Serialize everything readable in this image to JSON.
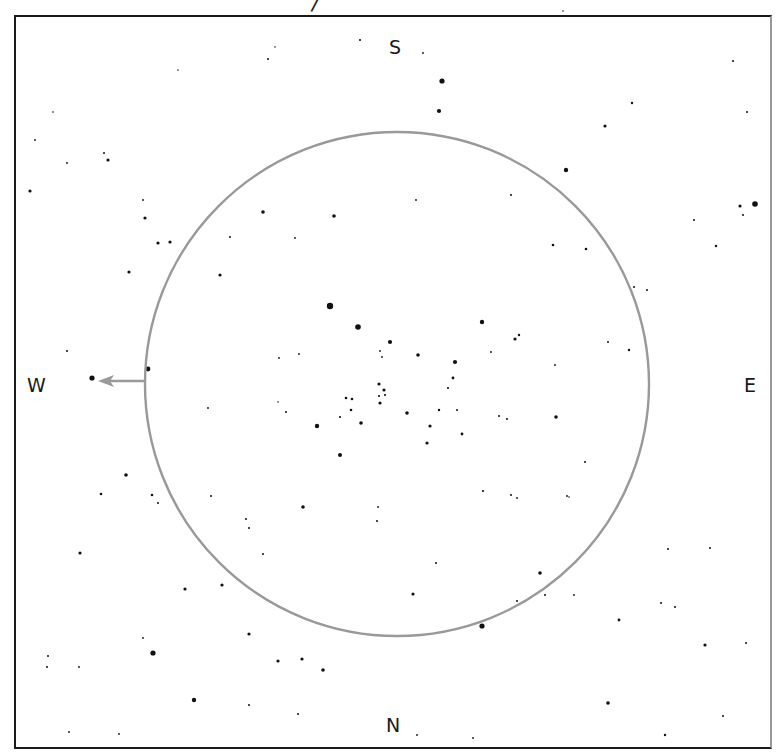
{
  "title_fragment": "/",
  "directions": {
    "north": "N",
    "south": "S",
    "east": "E",
    "west": "W"
  },
  "field_circle": {
    "cx": 397,
    "cy": 384,
    "r": 252,
    "stroke": "#999999"
  },
  "motion_arrow": {
    "from": [
      146,
      381
    ],
    "to": [
      98,
      381
    ],
    "color": "#9a9a9a",
    "target_star": [
      92,
      378
    ]
  },
  "stars": [
    {
      "x": 442,
      "y": 81,
      "r": 2.6
    },
    {
      "x": 439,
      "y": 111,
      "r": 2.1
    },
    {
      "x": 566,
      "y": 170,
      "r": 2.2
    },
    {
      "x": 605,
      "y": 126,
      "r": 1.6
    },
    {
      "x": 632,
      "y": 103,
      "r": 1.2
    },
    {
      "x": 755,
      "y": 204,
      "r": 2.8
    },
    {
      "x": 740,
      "y": 206,
      "r": 1.6
    },
    {
      "x": 743,
      "y": 215,
      "r": 1.0
    },
    {
      "x": 716,
      "y": 246,
      "r": 1.2
    },
    {
      "x": 694,
      "y": 220,
      "r": 1.0
    },
    {
      "x": 747,
      "y": 112,
      "r": 1.0
    },
    {
      "x": 733,
      "y": 61,
      "r": 1.0
    },
    {
      "x": 563,
      "y": 11,
      "r": 0.8
    },
    {
      "x": 360,
      "y": 40,
      "r": 1.1
    },
    {
      "x": 423,
      "y": 53,
      "r": 0.9
    },
    {
      "x": 268,
      "y": 59,
      "r": 1.0
    },
    {
      "x": 275,
      "y": 47,
      "r": 0.8
    },
    {
      "x": 178,
      "y": 70,
      "r": 0.8
    },
    {
      "x": 30,
      "y": 191,
      "r": 1.6
    },
    {
      "x": 104,
      "y": 153,
      "r": 1.0
    },
    {
      "x": 108,
      "y": 160,
      "r": 1.6
    },
    {
      "x": 67,
      "y": 163,
      "r": 0.9
    },
    {
      "x": 35,
      "y": 140,
      "r": 0.9
    },
    {
      "x": 53,
      "y": 112,
      "r": 0.8
    },
    {
      "x": 143,
      "y": 200,
      "r": 0.9
    },
    {
      "x": 145,
      "y": 218,
      "r": 1.6
    },
    {
      "x": 158,
      "y": 243,
      "r": 1.6
    },
    {
      "x": 170,
      "y": 242,
      "r": 1.6
    },
    {
      "x": 129,
      "y": 272,
      "r": 1.6
    },
    {
      "x": 230,
      "y": 237,
      "r": 1.0
    },
    {
      "x": 263,
      "y": 212,
      "r": 1.8
    },
    {
      "x": 334,
      "y": 216,
      "r": 1.8
    },
    {
      "x": 295,
      "y": 238,
      "r": 0.9
    },
    {
      "x": 416,
      "y": 200,
      "r": 0.9
    },
    {
      "x": 511,
      "y": 195,
      "r": 1.0
    },
    {
      "x": 553,
      "y": 245,
      "r": 1.3
    },
    {
      "x": 586,
      "y": 249,
      "r": 1.3
    },
    {
      "x": 634,
      "y": 287,
      "r": 1.0
    },
    {
      "x": 647,
      "y": 290,
      "r": 1.0
    },
    {
      "x": 220,
      "y": 275,
      "r": 1.6
    },
    {
      "x": 330,
      "y": 306,
      "r": 3.2
    },
    {
      "x": 358,
      "y": 327,
      "r": 2.8
    },
    {
      "x": 390,
      "y": 342,
      "r": 2.1
    },
    {
      "x": 482,
      "y": 322,
      "r": 2.2
    },
    {
      "x": 515,
      "y": 339,
      "r": 1.6
    },
    {
      "x": 519,
      "y": 335,
      "r": 1.2
    },
    {
      "x": 455,
      "y": 362,
      "r": 2.1
    },
    {
      "x": 418,
      "y": 355,
      "r": 1.8
    },
    {
      "x": 453,
      "y": 378,
      "r": 1.4
    },
    {
      "x": 448,
      "y": 388,
      "r": 1.1
    },
    {
      "x": 380,
      "y": 351,
      "r": 0.9
    },
    {
      "x": 382,
      "y": 357,
      "r": 0.9
    },
    {
      "x": 379,
      "y": 384,
      "r": 1.6
    },
    {
      "x": 384,
      "y": 390,
      "r": 1.6
    },
    {
      "x": 379,
      "y": 396,
      "r": 1.1
    },
    {
      "x": 385,
      "y": 395,
      "r": 1.1
    },
    {
      "x": 380,
      "y": 403,
      "r": 1.6
    },
    {
      "x": 352,
      "y": 399,
      "r": 1.3
    },
    {
      "x": 346,
      "y": 398,
      "r": 1.3
    },
    {
      "x": 351,
      "y": 410,
      "r": 1.3
    },
    {
      "x": 340,
      "y": 417,
      "r": 1.1
    },
    {
      "x": 361,
      "y": 423,
      "r": 1.8
    },
    {
      "x": 317,
      "y": 426,
      "r": 2.2
    },
    {
      "x": 340,
      "y": 455,
      "r": 2.0
    },
    {
      "x": 299,
      "y": 354,
      "r": 0.9
    },
    {
      "x": 279,
      "y": 358,
      "r": 0.9
    },
    {
      "x": 286,
      "y": 412,
      "r": 1.0
    },
    {
      "x": 278,
      "y": 402,
      "r": 0.8
    },
    {
      "x": 407,
      "y": 413,
      "r": 1.8
    },
    {
      "x": 430,
      "y": 426,
      "r": 1.6
    },
    {
      "x": 439,
      "y": 410,
      "r": 1.2
    },
    {
      "x": 427,
      "y": 443,
      "r": 1.6
    },
    {
      "x": 457,
      "y": 410,
      "r": 1.0
    },
    {
      "x": 462,
      "y": 434,
      "r": 1.4
    },
    {
      "x": 499,
      "y": 416,
      "r": 1.0
    },
    {
      "x": 507,
      "y": 419,
      "r": 1.0
    },
    {
      "x": 556,
      "y": 417,
      "r": 1.8
    },
    {
      "x": 491,
      "y": 352,
      "r": 0.9
    },
    {
      "x": 555,
      "y": 365,
      "r": 0.9
    },
    {
      "x": 608,
      "y": 342,
      "r": 1.0
    },
    {
      "x": 629,
      "y": 350,
      "r": 1.2
    },
    {
      "x": 148,
      "y": 369,
      "r": 2.4
    },
    {
      "x": 92,
      "y": 378,
      "r": 2.6
    },
    {
      "x": 67,
      "y": 351,
      "r": 1.0
    },
    {
      "x": 208,
      "y": 408,
      "r": 0.9
    },
    {
      "x": 126,
      "y": 475,
      "r": 1.8
    },
    {
      "x": 101,
      "y": 494,
      "r": 1.3
    },
    {
      "x": 152,
      "y": 495,
      "r": 1.3
    },
    {
      "x": 158,
      "y": 503,
      "r": 1.0
    },
    {
      "x": 211,
      "y": 496,
      "r": 1.0
    },
    {
      "x": 303,
      "y": 507,
      "r": 1.8
    },
    {
      "x": 246,
      "y": 519,
      "r": 1.0
    },
    {
      "x": 249,
      "y": 528,
      "r": 1.0
    },
    {
      "x": 377,
      "y": 521,
      "r": 1.0
    },
    {
      "x": 378,
      "y": 507,
      "r": 0.9
    },
    {
      "x": 483,
      "y": 491,
      "r": 1.1
    },
    {
      "x": 511,
      "y": 495,
      "r": 1.0
    },
    {
      "x": 585,
      "y": 462,
      "r": 1.0
    },
    {
      "x": 80,
      "y": 553,
      "r": 1.6
    },
    {
      "x": 185,
      "y": 589,
      "r": 1.6
    },
    {
      "x": 222,
      "y": 585,
      "r": 1.6
    },
    {
      "x": 263,
      "y": 554,
      "r": 1.0
    },
    {
      "x": 413,
      "y": 594,
      "r": 1.6
    },
    {
      "x": 436,
      "y": 563,
      "r": 1.0
    },
    {
      "x": 540,
      "y": 573,
      "r": 1.8
    },
    {
      "x": 545,
      "y": 595,
      "r": 1.0
    },
    {
      "x": 517,
      "y": 498,
      "r": 0.9
    },
    {
      "x": 567,
      "y": 496,
      "r": 0.9
    },
    {
      "x": 482,
      "y": 626,
      "r": 2.6
    },
    {
      "x": 517,
      "y": 601,
      "r": 1.0
    },
    {
      "x": 249,
      "y": 634,
      "r": 1.6
    },
    {
      "x": 153,
      "y": 653,
      "r": 2.6
    },
    {
      "x": 143,
      "y": 638,
      "r": 0.9
    },
    {
      "x": 48,
      "y": 656,
      "r": 1.0
    },
    {
      "x": 79,
      "y": 667,
      "r": 0.9
    },
    {
      "x": 47,
      "y": 667,
      "r": 1.0
    },
    {
      "x": 278,
      "y": 661,
      "r": 1.6
    },
    {
      "x": 302,
      "y": 659,
      "r": 1.6
    },
    {
      "x": 323,
      "y": 670,
      "r": 1.8
    },
    {
      "x": 194,
      "y": 700,
      "r": 2.2
    },
    {
      "x": 249,
      "y": 705,
      "r": 1.0
    },
    {
      "x": 298,
      "y": 714,
      "r": 1.0
    },
    {
      "x": 69,
      "y": 732,
      "r": 0.9
    },
    {
      "x": 119,
      "y": 734,
      "r": 0.9
    },
    {
      "x": 661,
      "y": 603,
      "r": 1.0
    },
    {
      "x": 675,
      "y": 607,
      "r": 1.0
    },
    {
      "x": 705,
      "y": 645,
      "r": 1.6
    },
    {
      "x": 746,
      "y": 643,
      "r": 1.0
    },
    {
      "x": 619,
      "y": 620,
      "r": 1.4
    },
    {
      "x": 608,
      "y": 703,
      "r": 1.8
    },
    {
      "x": 665,
      "y": 735,
      "r": 1.2
    },
    {
      "x": 710,
      "y": 548,
      "r": 1.0
    },
    {
      "x": 723,
      "y": 716,
      "r": 1.0
    },
    {
      "x": 668,
      "y": 549,
      "r": 1.0
    },
    {
      "x": 417,
      "y": 735,
      "r": 0.9
    },
    {
      "x": 473,
      "y": 738,
      "r": 0.9
    },
    {
      "x": 569,
      "y": 497,
      "r": 0.8
    },
    {
      "x": 574,
      "y": 595,
      "r": 0.9
    }
  ]
}
